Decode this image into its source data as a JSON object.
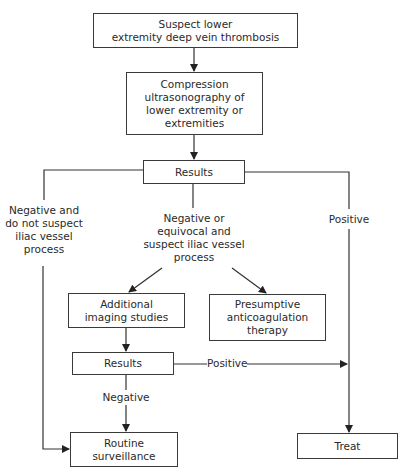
{
  "diagram": {
    "type": "flowchart",
    "nodes": {
      "start": "Suspect lower\nextremity deep vein thrombosis",
      "cus": "Compression\nultrasonography of\nlower extremity or\nextremities",
      "results1": "Results",
      "additional": "Additional\nimaging studies",
      "presumptive": "Presumptive\nanticoagulation\ntherapy",
      "results2": "Results",
      "routine": "Routine\nsurveillance",
      "treat": "Treat"
    },
    "edge_labels": {
      "neg_no_iliac": "Negative and\ndo not suspect\niliac vessel\nprocess",
      "neg_equivocal_iliac": "Negative or\nequivocal and\nsuspect iliac vessel\nprocess",
      "positive1": "Positive",
      "positive2": "Positive",
      "negative2": "Negative"
    }
  }
}
